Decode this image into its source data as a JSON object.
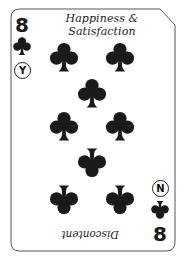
{
  "card": {
    "rank": "8",
    "suit": "clubs",
    "suit_icon": "club-icon",
    "pip_count": 8,
    "top_label": {
      "line1": "Happiness &",
      "line2": "Satisfaction"
    },
    "bottom_label": "Discontent",
    "top_corner": {
      "rank": "8",
      "answer_badge": "Y"
    },
    "bottom_corner": {
      "rank": "8",
      "answer_badge": "N"
    },
    "colors": {
      "ink": "#1a1a1a",
      "border": "#555555",
      "background": "#ffffff"
    }
  }
}
